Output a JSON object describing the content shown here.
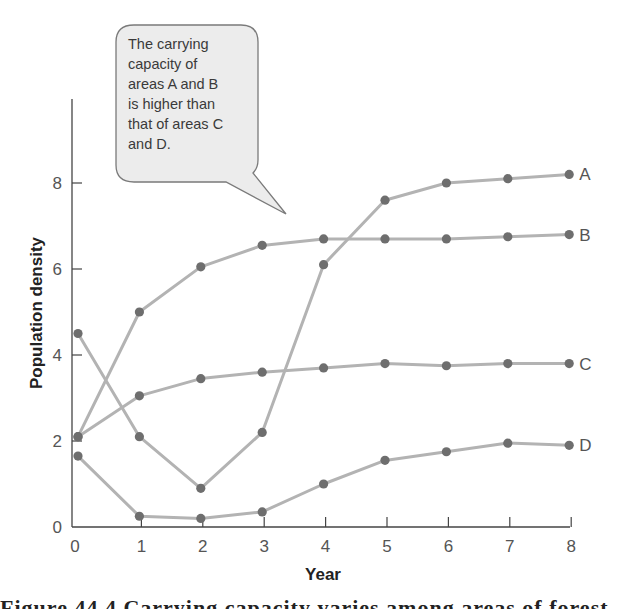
{
  "chart_data": {
    "type": "line",
    "title": "",
    "xlabel": "Year",
    "ylabel": "Population density",
    "x": [
      0,
      1,
      2,
      3,
      4,
      5,
      6,
      7,
      8
    ],
    "xticks": [
      "0",
      "1",
      "2",
      "3",
      "4",
      "5",
      "6",
      "7",
      "8"
    ],
    "yticks": [
      "0",
      "2",
      "4",
      "6",
      "8"
    ],
    "xlim": [
      0,
      8
    ],
    "ylim": [
      0,
      9.8
    ],
    "grid": false,
    "legend": "direct labels at right end of each line",
    "series": [
      {
        "name": "A",
        "values": [
          4.5,
          2.1,
          0.9,
          2.2,
          6.1,
          7.6,
          8.0,
          8.1,
          8.2
        ]
      },
      {
        "name": "B",
        "values": [
          2.1,
          5.0,
          6.05,
          6.55,
          6.7,
          6.7,
          6.7,
          6.75,
          6.8
        ]
      },
      {
        "name": "C",
        "values": [
          2.1,
          3.05,
          3.45,
          3.6,
          3.7,
          3.8,
          3.75,
          3.8,
          3.8
        ]
      },
      {
        "name": "D",
        "values": [
          1.65,
          0.25,
          0.2,
          0.35,
          1.0,
          1.55,
          1.75,
          1.95,
          1.9
        ]
      }
    ],
    "annotations": [
      {
        "type": "callout",
        "text_lines": [
          "The carrying",
          "capacity of",
          "areas A and B",
          "is higher than",
          "that of areas C",
          "and D."
        ]
      }
    ],
    "colors": {
      "line": "#b3b3b3",
      "marker": "#6e6e6e",
      "axis": "#444444",
      "callout_fill": "#ececec",
      "callout_stroke": "#777777"
    }
  },
  "caption": {
    "text": "Figure 44.4 Carrying capacity varies among areas of forest."
  }
}
